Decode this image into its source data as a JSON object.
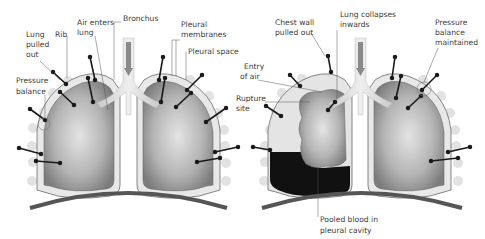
{
  "diagram": {
    "left_panel": {
      "state": "normal",
      "labels": {
        "lung_pulled_out": [
          "Lung",
          "pulled",
          "out"
        ],
        "rib": "Rib",
        "air_enters_lung": [
          "Air enters",
          "lung"
        ],
        "bronchus": "Bronchus",
        "pleural_membranes": [
          "Pleural",
          "membranes"
        ],
        "pleural_space": "Pleural space",
        "pressure_balance": [
          "Pressure",
          "balance"
        ]
      }
    },
    "right_panel": {
      "state": "collapsed",
      "labels": {
        "chest_wall_pulled_out": [
          "Chest wall",
          "pulled out"
        ],
        "lung_collapses_inwards": [
          "Lung collapses",
          "inwards"
        ],
        "pressure_balance_maintained": [
          "Pressure",
          "balance",
          "maintained"
        ],
        "entry_of_air": [
          "Entry",
          "of air"
        ],
        "rupture_site": [
          "Rupture",
          "site"
        ],
        "pooled_blood": [
          "Pooled blood in",
          "pleural cavity"
        ]
      }
    },
    "colors": {
      "lung_dark": "#7a7a7a",
      "lung_light": "#d8d8d8",
      "pleura": "#e6e6e6",
      "outline": "#6a6a6a",
      "blood": "#111111",
      "diaphragm": "#555555",
      "arrow": "#1a1a1a"
    }
  }
}
